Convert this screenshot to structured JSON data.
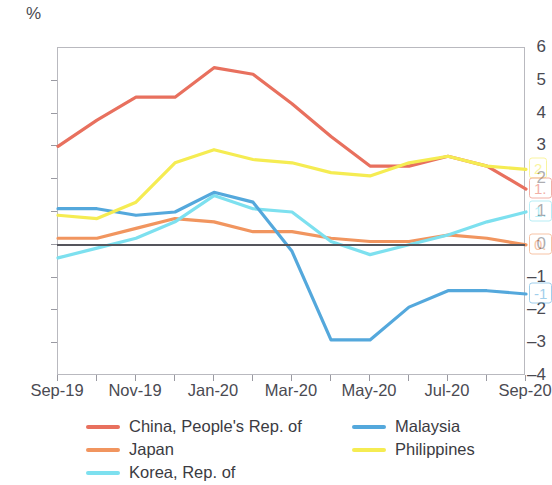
{
  "axis": {
    "unit_label": "%",
    "y_ticks": [
      "6",
      "5",
      "4",
      "3",
      "2",
      "1",
      "0",
      "-1",
      "-2",
      "-3",
      "-4"
    ],
    "y_min": -4,
    "y_max": 6,
    "x_ticks": [
      "Sep-19",
      "Nov-19",
      "Jan-20",
      "Mar-20",
      "May-20",
      "Jul-20",
      "Sep-20"
    ]
  },
  "legend": {
    "left": [
      {
        "label": "China, People's Rep. of",
        "color": "#e8705e"
      },
      {
        "label": "Japan",
        "color": "#f1955f"
      },
      {
        "label": "Korea, Rep. of",
        "color": "#7de0ef"
      }
    ],
    "right": [
      {
        "label": "Malaysia",
        "color": "#54a8dc"
      },
      {
        "label": "Philippines",
        "color": "#f5ec52"
      }
    ]
  },
  "endpoint_labels": [
    {
      "name": "philippines",
      "text": "2",
      "value": 2.3,
      "color": "#f5ec52"
    },
    {
      "name": "china",
      "text": "1.",
      "value": 1.7,
      "color": "#e8705e"
    },
    {
      "name": "korea",
      "text": "1.",
      "value": 1.0,
      "color": "#7de0ef"
    },
    {
      "name": "japan",
      "text": "0.",
      "value": 0.0,
      "color": "#f1955f"
    },
    {
      "name": "malaysia",
      "text": "-1",
      "value": -1.5,
      "color": "#54a8dc"
    }
  ],
  "chart_data": {
    "type": "line",
    "title": "",
    "xlabel": "",
    "ylabel": "%",
    "ylim": [
      -4,
      6
    ],
    "grid": false,
    "legend_position": "bottom",
    "x": [
      "Sep-19",
      "Oct-19",
      "Nov-19",
      "Dec-19",
      "Jan-20",
      "Feb-20",
      "Mar-20",
      "Apr-20",
      "May-20",
      "Jun-20",
      "Jul-20",
      "Aug-20",
      "Sep-20"
    ],
    "series": [
      {
        "name": "China, People's Rep. of",
        "color": "#e8705e",
        "values": [
          3.0,
          3.8,
          4.5,
          4.5,
          5.4,
          5.2,
          4.3,
          3.3,
          2.4,
          2.4,
          2.7,
          2.4,
          1.7
        ]
      },
      {
        "name": "Japan",
        "color": "#f1955f",
        "values": [
          0.2,
          0.2,
          0.5,
          0.8,
          0.7,
          0.4,
          0.4,
          0.2,
          0.1,
          0.1,
          0.3,
          0.2,
          0.0
        ]
      },
      {
        "name": "Korea, Rep. of",
        "color": "#7de0ef",
        "values": [
          -0.4,
          -0.1,
          0.2,
          0.7,
          1.5,
          1.1,
          1.0,
          0.1,
          -0.3,
          0.0,
          0.3,
          0.7,
          1.0
        ]
      },
      {
        "name": "Malaysia",
        "color": "#54a8dc",
        "values": [
          1.1,
          1.1,
          0.9,
          1.0,
          1.6,
          1.3,
          -0.2,
          -2.9,
          -2.9,
          -1.9,
          -1.4,
          -1.4,
          -1.5
        ]
      },
      {
        "name": "Philippines",
        "color": "#f5ec52",
        "values": [
          0.9,
          0.8,
          1.3,
          2.5,
          2.9,
          2.6,
          2.5,
          2.2,
          2.1,
          2.5,
          2.7,
          2.4,
          2.3
        ]
      }
    ]
  }
}
